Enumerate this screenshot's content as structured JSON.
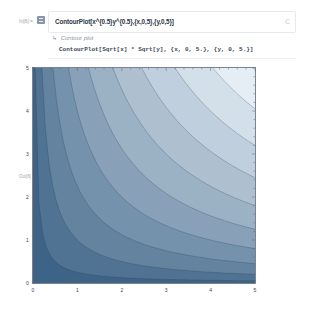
{
  "notebook": {
    "input_label": "In[6]:=",
    "input_code": "ContourPlot[x^{0.5}y^{0.5},{x,0,5},{y,0,5}]",
    "natural_language_label": "Contour plot",
    "interpreted_code": "ContourPlot[Sqrt[x] * Sqrt[y], {x, 0, 5.}, {y, 0, 5.}]",
    "output_label": "Out[6]=",
    "cell_icon": "C"
  },
  "chart_data": {
    "type": "contour",
    "function": "Sqrt[x] * Sqrt[y]",
    "title": "",
    "xlabel": "",
    "ylabel": "",
    "xlim": [
      0,
      5
    ],
    "ylim": [
      0,
      5
    ],
    "x_ticks": [
      "0",
      "1",
      "2",
      "3",
      "4",
      "5"
    ],
    "y_ticks": [
      "0",
      "1",
      "2",
      "3",
      "4",
      "5"
    ],
    "contour_levels": [
      0.5,
      1.0,
      1.5,
      2.0,
      2.5,
      3.0,
      3.5,
      4.0,
      4.5
    ],
    "color_low": "#3d6487",
    "color_high": "#e6eef5",
    "grid": false,
    "legend": "none"
  },
  "icons": {
    "cell_toggle": "list-toggle-icon",
    "nl_arrow": "↳"
  }
}
